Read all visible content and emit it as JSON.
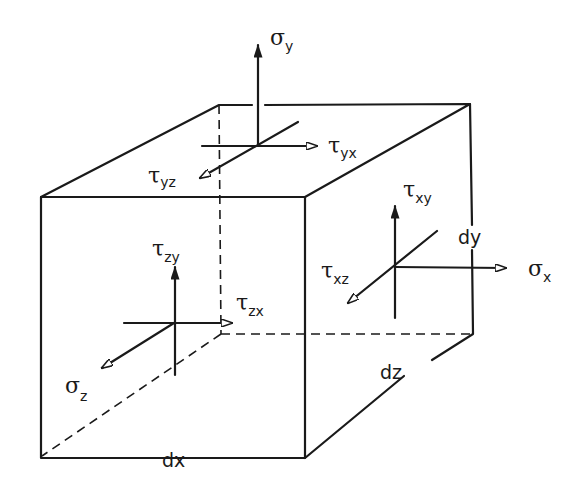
{
  "diagram": {
    "style": "hand-drawn sketch, black ink on white",
    "dimensions": {
      "dx": "dx",
      "dy": "dy",
      "dz": "dz"
    },
    "faces": {
      "top": {
        "normal_label": {
          "symbol": "σ",
          "sub": "y"
        },
        "shear_1": {
          "symbol": "τ",
          "sub": "yx"
        },
        "shear_2": {
          "symbol": "τ",
          "sub": "yz"
        }
      },
      "right": {
        "normal_label": {
          "symbol": "σ",
          "sub": "x"
        },
        "shear_1": {
          "symbol": "τ",
          "sub": "xy"
        },
        "shear_2": {
          "symbol": "τ",
          "sub": "xz"
        }
      },
      "front": {
        "normal_label": {
          "symbol": "σ",
          "sub": "z"
        },
        "shear_1": {
          "symbol": "τ",
          "sub": "zy"
        },
        "shear_2": {
          "symbol": "τ",
          "sub": "zx"
        }
      }
    }
  }
}
